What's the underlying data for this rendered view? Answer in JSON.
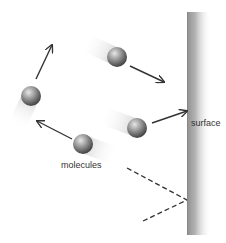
{
  "diagram": {
    "labels": {
      "molecules": "molecules",
      "surface": "surface"
    },
    "colors": {
      "background": "#ffffff",
      "surface_dark": "#8f8f8f",
      "surface_light": "#ffffff",
      "molecule_highlight": "#d8d8d8",
      "molecule_shadow": "#4a4a4a",
      "arrow": "#333333",
      "dashed": "#333333",
      "streak": "#cfcfcf"
    },
    "surface": {
      "x": 187,
      "y": 12,
      "width": 24,
      "height": 223
    },
    "molecules": [
      {
        "id": "m1",
        "cx": 31,
        "cy": 96,
        "r": 10,
        "streak_angle": 115
      },
      {
        "id": "m2",
        "cx": 117,
        "cy": 57,
        "r": 10,
        "streak_angle": 205
      },
      {
        "id": "m3",
        "cx": 83,
        "cy": 144,
        "r": 10,
        "streak_angle": 20
      },
      {
        "id": "m4",
        "cx": 137,
        "cy": 128,
        "r": 10,
        "streak_angle": 200
      }
    ],
    "arrows": [
      {
        "id": "a1",
        "x1": 36,
        "y1": 79,
        "x2": 52,
        "y2": 45
      },
      {
        "id": "a2",
        "x1": 130,
        "y1": 66,
        "x2": 164,
        "y2": 82
      },
      {
        "id": "a3",
        "x1": 72,
        "y1": 139,
        "x2": 37,
        "y2": 121
      },
      {
        "id": "a4",
        "x1": 152,
        "y1": 123,
        "x2": 187,
        "y2": 111
      }
    ],
    "dashed_lines": [
      {
        "id": "d1",
        "x1": 127,
        "y1": 168,
        "x2": 187,
        "y2": 200
      },
      {
        "id": "d2",
        "x1": 143,
        "y1": 221,
        "x2": 187,
        "y2": 200
      }
    ]
  }
}
